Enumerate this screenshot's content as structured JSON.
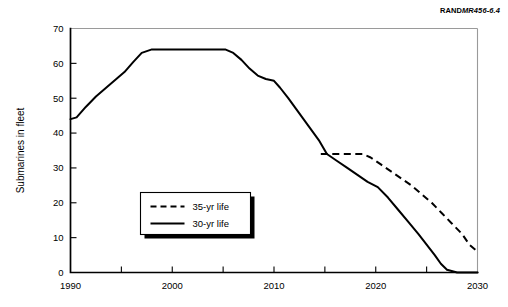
{
  "figure": {
    "rand_mark": "RAND",
    "rand_number": "MR456-6.4"
  },
  "chart_data": {
    "type": "line",
    "title": "",
    "xlabel": "",
    "ylabel": "Submarines in fleet",
    "xlim": [
      1990,
      2030
    ],
    "ylim": [
      0,
      70
    ],
    "xticks": [
      1990,
      2000,
      2010,
      2020,
      2030
    ],
    "xtick_labels": [
      "1990",
      "2000",
      "2010",
      "2020",
      "2030"
    ],
    "xminor_ticks": [
      1995,
      2000,
      2005,
      2010,
      2015,
      2020,
      2025
    ],
    "yticks": [
      0,
      10,
      20,
      30,
      40,
      50,
      60,
      70
    ],
    "ytick_labels": [
      "0",
      "10",
      "20",
      "30",
      "40",
      "50",
      "60",
      "70"
    ],
    "grid": false,
    "legend_position": "center-left",
    "series": [
      {
        "name": "35-yr life",
        "style": "dashed",
        "color": "#000000",
        "x": [
          2014.6,
          2015.5,
          2016.5,
          2017.5,
          2018.7,
          2019.5,
          2020.5,
          2021.5,
          2022.5,
          2023.5,
          2024.5,
          2025.5,
          2026.5,
          2027.5,
          2028.5,
          2029.2,
          2030.0
        ],
        "values": [
          34.0,
          34.0,
          34.0,
          34.0,
          34.0,
          33.0,
          31.0,
          29.0,
          27.0,
          25.0,
          22.5,
          20.0,
          17.0,
          14.0,
          11.0,
          8.0,
          6.0
        ]
      },
      {
        "name": "30-yr life",
        "style": "solid",
        "color": "#000000",
        "x": [
          1990.0,
          1990.6,
          1991.5,
          1992.5,
          1993.5,
          1994.5,
          1995.3,
          1996.2,
          1997.0,
          1998.0,
          2000.0,
          2002.0,
          2004.0,
          2005.2,
          2006.0,
          2006.8,
          2007.6,
          2008.4,
          2009.2,
          2010.0,
          2010.6,
          2011.4,
          2012.4,
          2013.4,
          2014.4,
          2015.2,
          2016.2,
          2017.2,
          2018.2,
          2019.2,
          2020.2,
          2021.2,
          2022.2,
          2023.2,
          2024.2,
          2025.0,
          2025.8,
          2026.4,
          2027.0,
          2028.0,
          2030.0
        ],
        "values": [
          44.0,
          44.5,
          47.5,
          50.5,
          53.0,
          55.5,
          57.5,
          60.5,
          63.0,
          64.0,
          64.0,
          64.0,
          64.0,
          64.0,
          63.0,
          61.0,
          58.5,
          56.5,
          55.5,
          55.0,
          53.0,
          50.0,
          46.0,
          42.0,
          38.0,
          34.0,
          32.0,
          30.0,
          28.0,
          26.0,
          24.5,
          21.5,
          18.0,
          14.5,
          11.0,
          8.0,
          5.0,
          2.5,
          0.8,
          0.0,
          0.0
        ]
      }
    ],
    "annotations": []
  }
}
